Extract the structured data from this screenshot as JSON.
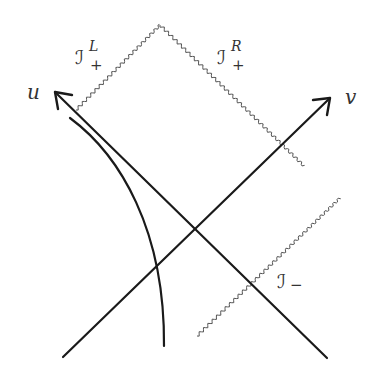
{
  "diagram": {
    "type": "penrose-diagram",
    "axes": {
      "u": {
        "label": "u",
        "from": [
          327,
          358
        ],
        "to": [
          55,
          92
        ]
      },
      "v": {
        "label": "v",
        "from": [
          63,
          357
        ],
        "to": [
          330,
          98
        ]
      }
    },
    "boundaries": {
      "scri_plus_left": {
        "symbol": "ℐ",
        "superscript": "L",
        "subscript": "+",
        "from": [
          76,
          110
        ],
        "to": [
          160,
          25
        ]
      },
      "scri_plus_right": {
        "symbol": "ℐ",
        "superscript": "R",
        "subscript": "+",
        "from": [
          160,
          25
        ],
        "to": [
          304,
          166
        ]
      },
      "scri_minus": {
        "symbol": "ℐ",
        "subscript": "−",
        "from": [
          197,
          336
        ],
        "to": [
          340,
          198
        ]
      }
    },
    "worldline": {
      "from": [
        70,
        118
      ],
      "to": [
        164,
        346
      ]
    },
    "colors": {
      "lines": "#1a1a1a",
      "wavy_boundaries": "#555555",
      "labels": "#333333",
      "background": "#ffffff"
    }
  }
}
